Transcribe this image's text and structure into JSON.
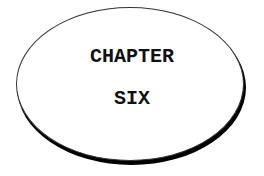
{
  "title": {
    "line1": "CHAPTER",
    "line2": "SIX"
  },
  "colors": {
    "background": "#ffffff",
    "outline": "#000000",
    "text": "#111111"
  }
}
